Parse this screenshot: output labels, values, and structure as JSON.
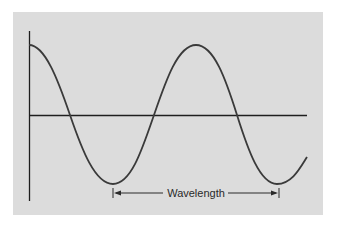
{
  "diagram": {
    "label": "Wavelength",
    "colors": {
      "background": "#dcdcdc",
      "curve": "#3a3a3a",
      "axis": "#1e1e1e",
      "text": "#2a2a2a"
    },
    "wave": {
      "type": "cosine",
      "start_phase": "crest",
      "crests": 2,
      "troughs": 2,
      "description": "Cosine wave starting at a crest on the vertical axis, crossing the horizontal axis three times"
    },
    "annotation": {
      "text": "Wavelength",
      "from": "trough 1",
      "to": "trough 2",
      "arrows": "double-headed"
    }
  }
}
